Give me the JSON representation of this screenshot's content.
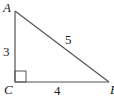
{
  "diagram": {
    "type": "right-triangle",
    "vertices": [
      {
        "label": "A",
        "x": 15,
        "y": 11
      },
      {
        "label": "C",
        "x": 15,
        "y": 82
      },
      {
        "label": "B",
        "x": 109,
        "y": 82
      }
    ],
    "sides": [
      {
        "between": "AC",
        "length_label": "3"
      },
      {
        "between": "CB",
        "length_label": "4"
      },
      {
        "between": "AB",
        "length_label": "5"
      }
    ],
    "right_angle_at": "C",
    "colors": {
      "stroke": "#555555",
      "text": "#222222"
    }
  }
}
